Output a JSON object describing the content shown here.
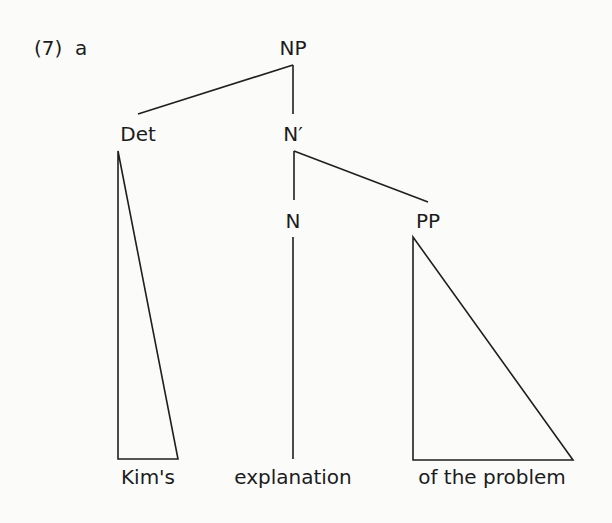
{
  "example": {
    "number": "(7)",
    "letter": "a"
  },
  "tree": {
    "root": {
      "label": "NP",
      "children": [
        {
          "label": "Det",
          "triangle": true,
          "leaf": "Kim's"
        },
        {
          "label": "N′",
          "children": [
            {
              "label": "N",
              "leaf": "explanation"
            },
            {
              "label": "PP",
              "triangle": true,
              "leaf": "of the problem"
            }
          ]
        }
      ]
    }
  },
  "nodes": {
    "np": "NP",
    "det": "Det",
    "nbar": "N′",
    "n": "N",
    "pp": "PP"
  },
  "leaves": {
    "det": "Kim's",
    "n": "explanation",
    "pp": "of the problem"
  }
}
